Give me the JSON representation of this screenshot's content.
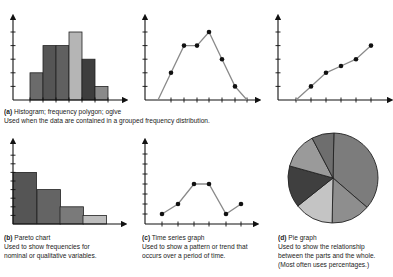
{
  "panels": {
    "a": {
      "label": "(a)",
      "title": "Histogram; frequency polygon; ogive",
      "description": "Used when the data are contained in a grouped frequency distribution."
    },
    "b": {
      "label": "(b)",
      "title": "Pareto chart",
      "description_lines": [
        "Used to show frequencies for",
        "nominal or qualitative variables."
      ]
    },
    "c": {
      "label": "(c)",
      "title": "Time series graph",
      "description_lines": [
        "Used to show a pattern or trend that",
        "occurs over a period of time."
      ]
    },
    "d": {
      "label": "(d)",
      "title": "Pie graph",
      "description_lines": [
        "Used to show the relationship",
        "between the parts and the whole.",
        "(Most often uses percentages.)"
      ]
    }
  },
  "chart_data": [
    {
      "type": "bar",
      "title": "Histogram",
      "categories": [
        "1",
        "2",
        "3",
        "4",
        "5",
        "6"
      ],
      "values": [
        2,
        4,
        4,
        5,
        3,
        1
      ],
      "colors": [
        "#6b6b6b",
        "#555555",
        "#606060",
        "#b5b5b5",
        "#3e3e3e",
        "#8a8a8a"
      ],
      "ylim": [
        0,
        6
      ],
      "grid": false
    },
    {
      "type": "line",
      "title": "Frequency polygon",
      "x": [
        0,
        1,
        2,
        3,
        4,
        5,
        6,
        7
      ],
      "values": [
        0,
        2,
        4,
        4,
        5,
        3,
        1,
        0
      ],
      "ylim": [
        0,
        6
      ],
      "grid": false
    },
    {
      "type": "line",
      "title": "Ogive",
      "x": [
        0,
        1,
        2,
        3,
        4,
        5
      ],
      "values": [
        0,
        1,
        2,
        2.5,
        3,
        4
      ],
      "ylim": [
        0,
        6
      ],
      "grid": false
    },
    {
      "type": "bar",
      "title": "Pareto chart",
      "categories": [
        "A",
        "B",
        "C",
        "D"
      ],
      "values": [
        6,
        4,
        2,
        1
      ],
      "colors": [
        "#555555",
        "#646464",
        "#7a7a7a",
        "#bdbdbd"
      ],
      "ylim": [
        0,
        9
      ],
      "grid": false
    },
    {
      "type": "line",
      "title": "Time series graph",
      "x": [
        1,
        2,
        3,
        4,
        5,
        6
      ],
      "values": [
        1,
        2,
        4,
        4,
        1,
        2
      ],
      "ylim": [
        0,
        8
      ],
      "grid": false
    },
    {
      "type": "pie",
      "title": "Pie graph",
      "slices": [
        {
          "label": "slice-1",
          "value": 36,
          "color": "#7c7c7c"
        },
        {
          "label": "slice-2",
          "value": 14,
          "color": "#8e8e8e"
        },
        {
          "label": "slice-3",
          "value": 14,
          "color": "#c4c4c4"
        },
        {
          "label": "slice-4",
          "value": 15,
          "color": "#3f3f3f"
        },
        {
          "label": "slice-5",
          "value": 13,
          "color": "#9a9a9a"
        },
        {
          "label": "slice-6",
          "value": 8,
          "color": "#6e6e6e"
        }
      ]
    }
  ]
}
